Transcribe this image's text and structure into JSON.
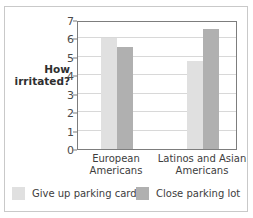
{
  "chart_data": {
    "type": "bar",
    "title": "",
    "subtitle": "",
    "xlabel": "",
    "ylabel": "How irritated?",
    "ylim": [
      0,
      7
    ],
    "yticks": [
      0,
      1,
      2,
      3,
      4,
      5,
      6,
      7
    ],
    "ytick_labels": [
      "0",
      "1",
      "2",
      "3",
      "4",
      "5",
      "6",
      "7"
    ],
    "grid": "horizontal",
    "legend_position": "bottom",
    "categories": [
      "European Americans",
      "Latinos and Asian Americans"
    ],
    "category_lines": [
      [
        "European",
        "Americans"
      ],
      [
        "Latinos and Asian",
        "Americans"
      ]
    ],
    "series": [
      {
        "name": "Give up parking card",
        "color": "#e0e0e0",
        "values": [
          6.05,
          4.75
        ]
      },
      {
        "name": "Close parking lot",
        "color": "#b0b0b0",
        "values": [
          5.55,
          6.5
        ]
      }
    ]
  },
  "figure": {
    "background_color": "#ffffff",
    "frame_color": "#c9c9c9",
    "axis_color": "#7d7d7d",
    "gridline_color": "#d8d8d8"
  }
}
